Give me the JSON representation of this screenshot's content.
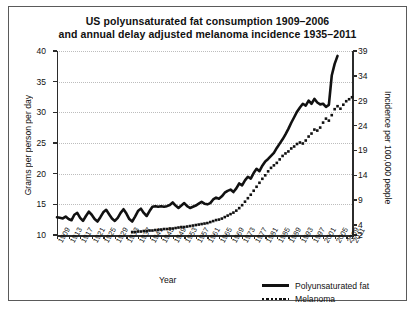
{
  "chart_data": {
    "type": "line",
    "title_line1": "US polyunsaturated fat consumption 1909–2006",
    "title_line2": "and annual delay adjusted melanoma incidence 1935–2011",
    "xlabel": "Year",
    "ylabel_left": "Grams per person per day",
    "ylabel_right": "Incidence per 100,000 people",
    "grid": "horizontal dotted",
    "legend_position": "bottom-right",
    "xlim": [
      1909,
      2011
    ],
    "ylim_left": [
      10,
      40
    ],
    "ylim_right": [
      2,
      39
    ],
    "yticks_left": [
      10,
      15,
      20,
      25,
      30,
      35,
      40
    ],
    "yticks_right": [
      2,
      4,
      9,
      14,
      19,
      24,
      29,
      34,
      39
    ],
    "xticks": [
      1909,
      1913,
      1917,
      1921,
      1925,
      1929,
      1933,
      1937,
      1941,
      1945,
      1949,
      1953,
      1957,
      1961,
      1965,
      1969,
      1973,
      1977,
      1981,
      1985,
      1989,
      1993,
      1997,
      2001,
      2005,
      2009,
      2011
    ],
    "series": [
      {
        "name": "Polyunsaturated fat",
        "axis": "left",
        "style": "solid",
        "color": "#111111",
        "x": [
          1909,
          1910,
          1911,
          1912,
          1913,
          1914,
          1915,
          1916,
          1917,
          1918,
          1919,
          1920,
          1921,
          1922,
          1923,
          1924,
          1925,
          1926,
          1927,
          1928,
          1929,
          1930,
          1931,
          1932,
          1933,
          1934,
          1935,
          1936,
          1937,
          1938,
          1939,
          1940,
          1941,
          1942,
          1943,
          1944,
          1945,
          1946,
          1947,
          1948,
          1949,
          1950,
          1951,
          1952,
          1953,
          1954,
          1955,
          1956,
          1957,
          1958,
          1959,
          1960,
          1961,
          1962,
          1963,
          1964,
          1965,
          1966,
          1967,
          1968,
          1969,
          1970,
          1971,
          1972,
          1973,
          1974,
          1975,
          1976,
          1977,
          1978,
          1979,
          1980,
          1981,
          1982,
          1983,
          1984,
          1985,
          1986,
          1987,
          1988,
          1989,
          1990,
          1991,
          1992,
          1993,
          1994,
          1995,
          1996,
          1997,
          1998,
          1999,
          2000,
          2001,
          2002,
          2003,
          2004,
          2005,
          2006
        ],
        "values": [
          12.9,
          12.8,
          12.7,
          13.0,
          12.6,
          12.4,
          13.3,
          13.6,
          12.8,
          12.3,
          13.1,
          13.8,
          13.3,
          12.6,
          12.2,
          12.9,
          13.7,
          14.1,
          13.4,
          12.7,
          12.3,
          12.8,
          13.6,
          14.2,
          13.5,
          12.6,
          12.2,
          13.0,
          13.9,
          14.3,
          13.6,
          13.1,
          13.9,
          14.6,
          14.7,
          14.6,
          14.7,
          14.6,
          14.7,
          14.9,
          15.3,
          14.8,
          14.4,
          14.8,
          15.2,
          14.7,
          14.4,
          14.6,
          14.8,
          15.1,
          15.4,
          15.1,
          15.0,
          15.2,
          15.8,
          16.1,
          15.9,
          16.3,
          16.9,
          17.2,
          17.4,
          17.0,
          17.6,
          18.4,
          18.1,
          18.9,
          19.5,
          19.2,
          20.1,
          20.8,
          20.4,
          21.3,
          22.0,
          22.4,
          22.9,
          23.4,
          24.2,
          24.9,
          25.6,
          26.4,
          27.3,
          28.3,
          29.2,
          30.1,
          30.8,
          31.4,
          31.1,
          31.9,
          31.4,
          32.2,
          31.6,
          31.3,
          31.4,
          30.9,
          31.2,
          36.0,
          37.9,
          39.2
        ]
      },
      {
        "name": "Melanoma",
        "axis": "right",
        "style": "dotted",
        "color": "#111111",
        "x": [
          1935,
          1936,
          1937,
          1938,
          1939,
          1940,
          1941,
          1942,
          1943,
          1944,
          1945,
          1946,
          1947,
          1948,
          1949,
          1950,
          1951,
          1952,
          1953,
          1954,
          1955,
          1956,
          1957,
          1958,
          1959,
          1960,
          1961,
          1962,
          1963,
          1964,
          1965,
          1966,
          1967,
          1968,
          1969,
          1970,
          1971,
          1972,
          1973,
          1974,
          1975,
          1976,
          1977,
          1978,
          1979,
          1980,
          1981,
          1982,
          1983,
          1984,
          1985,
          1986,
          1987,
          1988,
          1989,
          1990,
          1991,
          1992,
          1993,
          1994,
          1995,
          1996,
          1997,
          1998,
          1999,
          2000,
          2001,
          2002,
          2003,
          2004,
          2005,
          2006,
          2007,
          2008,
          2009,
          2010,
          2011
        ],
        "values": [
          2.6,
          2.6,
          2.7,
          2.7,
          2.8,
          2.8,
          2.9,
          2.9,
          3.0,
          3.0,
          3.1,
          3.2,
          3.2,
          3.3,
          3.3,
          3.4,
          3.5,
          3.6,
          3.6,
          3.7,
          3.8,
          3.9,
          4.0,
          4.1,
          4.2,
          4.3,
          4.4,
          4.6,
          4.8,
          5.0,
          5.1,
          5.3,
          5.6,
          5.9,
          6.2,
          6.5,
          6.9,
          7.4,
          8.0,
          8.7,
          9.4,
          10.1,
          10.9,
          11.7,
          12.5,
          13.3,
          14.0,
          14.8,
          15.5,
          16.0,
          16.5,
          17.2,
          17.9,
          18.4,
          18.8,
          19.4,
          19.8,
          20.3,
          20.6,
          20.4,
          21.0,
          21.8,
          22.4,
          23.2,
          23.0,
          23.6,
          24.6,
          25.4,
          25.0,
          26.1,
          27.3,
          27.9,
          27.4,
          28.2,
          28.9,
          29.3,
          29.7
        ]
      }
    ]
  },
  "legend": {
    "items": [
      {
        "label": "Polyunsaturated fat"
      },
      {
        "label": "Melanoma"
      }
    ]
  }
}
